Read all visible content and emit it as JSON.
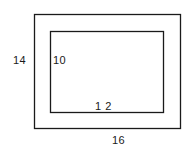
{
  "diagram": {
    "outer_rectangle": {
      "width_label": "16",
      "height_label": "14"
    },
    "inner_rectangle": {
      "width_label": "1 2",
      "height_label": "10"
    },
    "colors": {
      "stroke": "#1a1a1a",
      "background": "#ffffff"
    }
  }
}
